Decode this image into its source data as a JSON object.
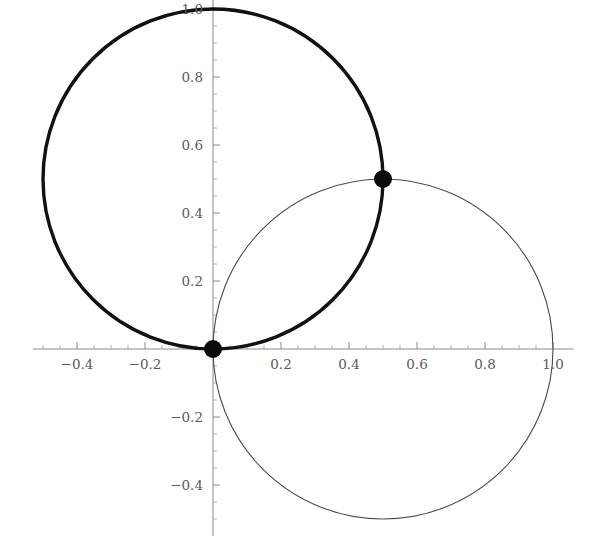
{
  "figure": {
    "background_color": "#ffffff",
    "axis_color": "#8a8a8a",
    "thick_curve_color": "#111111",
    "thin_curve_color": "#4a4a4a",
    "point_color": "#0b0b0b"
  },
  "chart_data": {
    "type": "scatter",
    "title": "",
    "subtitle": "",
    "xlabel": "",
    "ylabel": "",
    "grid": false,
    "legend": "none",
    "xlim": [
      -0.53,
      1.06
    ],
    "ylim": [
      -0.55,
      1.04
    ],
    "x_ticks": [
      -0.4,
      -0.2,
      0.2,
      0.4,
      0.6,
      0.8,
      1.0
    ],
    "x_tick_labels": [
      "-0.4",
      "-0.2",
      "0.2",
      "0.4",
      "0.6",
      "0.8",
      "1.0"
    ],
    "y_ticks": [
      -0.4,
      -0.2,
      0.2,
      0.4,
      0.6,
      0.8,
      1.0
    ],
    "y_tick_labels": [
      "-0.4",
      "-0.2",
      "0.2",
      "0.4",
      "0.6",
      "0.8",
      "1.0"
    ],
    "x_minor_tick_step": 0.05,
    "y_minor_tick_step": 0.05,
    "series": [
      {
        "name": "thick-circle",
        "shape": "circle",
        "center": [
          0.0,
          0.5
        ],
        "radius": 0.5,
        "stroke_width": 3.4,
        "color": "#111111"
      },
      {
        "name": "thin-circle",
        "shape": "circle",
        "center": [
          0.5,
          0.0
        ],
        "radius": 0.5,
        "stroke_width": 1.1,
        "color": "#4a4a4a"
      }
    ],
    "points": [
      {
        "name": "origin-intersection",
        "x": 0.0,
        "y": 0.0,
        "radius_px": 9
      },
      {
        "name": "upper-intersection",
        "x": 0.5,
        "y": 0.5,
        "radius_px": 9
      }
    ]
  }
}
